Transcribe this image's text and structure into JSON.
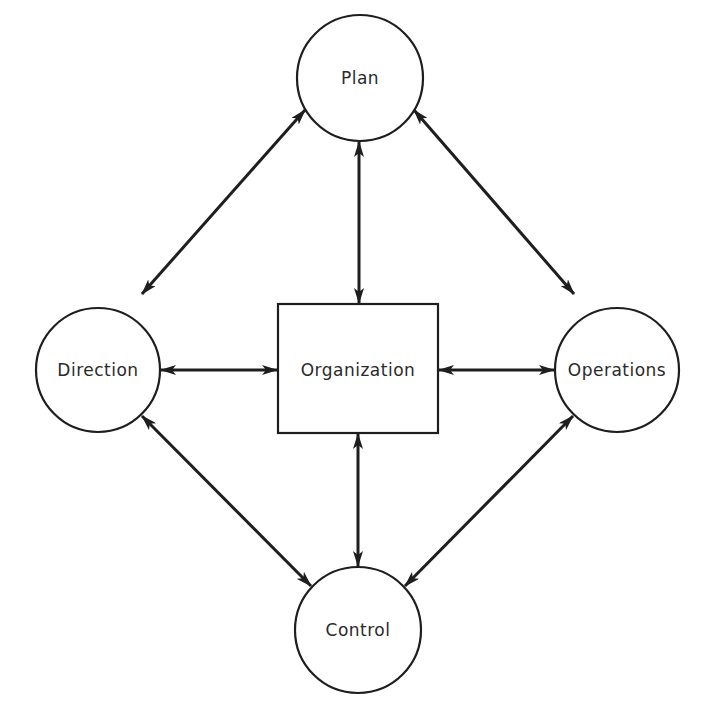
{
  "diagram": {
    "type": "management-cycle",
    "nodes": {
      "plan": {
        "label": "Plan",
        "shape": "circle",
        "cx": 360,
        "cy": 78,
        "r": 63
      },
      "direction": {
        "label": "Direction",
        "shape": "circle",
        "cx": 98,
        "cy": 370,
        "r": 62
      },
      "operations": {
        "label": "Operations",
        "shape": "circle",
        "cx": 617,
        "cy": 370,
        "r": 62
      },
      "control": {
        "label": "Control",
        "shape": "circle",
        "cx": 358,
        "cy": 630,
        "r": 63
      },
      "organization": {
        "label": "Organization",
        "shape": "rectangle",
        "x": 278,
        "y": 304,
        "width": 160,
        "height": 129
      }
    },
    "edges": [
      {
        "from": "plan",
        "to": "direction",
        "bidirectional": true
      },
      {
        "from": "plan",
        "to": "organization",
        "bidirectional": true
      },
      {
        "from": "plan",
        "to": "operations",
        "bidirectional": true
      },
      {
        "from": "direction",
        "to": "organization",
        "bidirectional": true
      },
      {
        "from": "organization",
        "to": "operations",
        "bidirectional": true
      },
      {
        "from": "direction",
        "to": "control",
        "bidirectional": true
      },
      {
        "from": "organization",
        "to": "control",
        "bidirectional": true
      },
      {
        "from": "operations",
        "to": "control",
        "bidirectional": true
      }
    ],
    "colors": {
      "stroke": "#1e1e1e",
      "background": "#ffffff",
      "text": "#2a2a2a"
    }
  }
}
